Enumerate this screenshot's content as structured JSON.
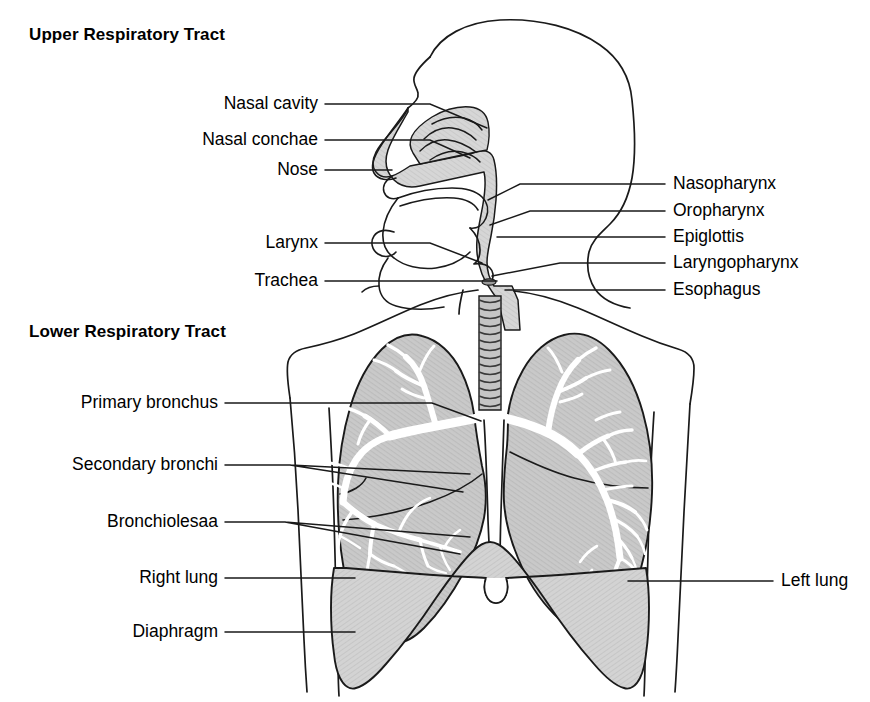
{
  "figure": {
    "kind": "anatomical-diagram",
    "background_color": "#ffffff",
    "ink_color": "#1a1a1a",
    "lung_fill_color": "#c9c9c9",
    "airway_fill_color": "#d6d6d6",
    "diaphragm_fill_color": "#d2d2d2",
    "bronchial_tree_color": "#ffffff"
  },
  "sections": {
    "upper": {
      "title": "Upper Respiratory Tract",
      "x": 29,
      "y": 25
    },
    "lower": {
      "title": "Lower Respiratory Tract",
      "x": 29,
      "y": 322
    }
  },
  "labels_left": [
    {
      "name": "nasal-cavity",
      "text": "Nasal cavity",
      "text_right": 318,
      "y": 104,
      "leader": "M 325 104 L 430 104 L 487 128"
    },
    {
      "name": "nasal-conchae",
      "text": "Nasal conchae",
      "text_right": 318,
      "y": 140,
      "leader": "M 325 140 L 430 140 L 470 158"
    },
    {
      "name": "nose",
      "text": "Nose",
      "text_right": 318,
      "y": 170,
      "leader": "M 325 170 L 392 170"
    },
    {
      "name": "larynx",
      "text": "Larynx",
      "text_right": 318,
      "y": 243,
      "leader": "M 325 243 L 430 243 L 482 263"
    },
    {
      "name": "trachea",
      "text": "Trachea",
      "text_right": 318,
      "y": 281,
      "leader": "M 325 281 L 497 281"
    },
    {
      "name": "primary-bronchus",
      "text": "Primary bronchus",
      "text_right": 218,
      "y": 403,
      "leader": "M 225 403 L 432 403 L 481 421"
    },
    {
      "name": "secondary-bronchi",
      "text": "Secondary bronchi",
      "text_right": 218,
      "y": 465,
      "leader": "M 225 465 L 290 465 M 290 465 L 463 492 M 290 465 L 470 474"
    },
    {
      "name": "bronchioles",
      "text": "Bronchiolesaa",
      "text_right": 218,
      "y": 522,
      "leader": "M 225 522 L 285 522 M 285 522 L 470 537 M 285 522 L 460 554"
    },
    {
      "name": "right-lung",
      "text": "Right lung",
      "text_right": 218,
      "y": 578,
      "leader": "M 225 578 L 355 578"
    },
    {
      "name": "diaphragm",
      "text": "Diaphragm",
      "text_right": 218,
      "y": 632,
      "leader": "M 225 632 L 355 632"
    }
  ],
  "labels_right": [
    {
      "name": "nasopharynx",
      "text": "Nasopharynx",
      "text_left": 673,
      "y": 184,
      "leader": "M 665 184 L 520 184 L 488 200"
    },
    {
      "name": "oropharynx",
      "text": "Oropharynx",
      "text_left": 673,
      "y": 211,
      "leader": "M 665 211 L 530 211 L 490 225"
    },
    {
      "name": "epiglottis",
      "text": "Epiglottis",
      "text_left": 673,
      "y": 237,
      "leader": "M 665 237 L 497 237"
    },
    {
      "name": "laryngopharynx",
      "text": "Laryngopharynx",
      "text_left": 673,
      "y": 263,
      "leader": "M 665 263 L 560 263 L 492 276"
    },
    {
      "name": "esophagus",
      "text": "Esophagus",
      "text_left": 673,
      "y": 290,
      "leader": "M 665 290 L 505 290"
    },
    {
      "name": "left-lung",
      "text": "Left lung",
      "text_left": 781,
      "y": 581,
      "leader": "M 773 581 L 628 581"
    }
  ]
}
